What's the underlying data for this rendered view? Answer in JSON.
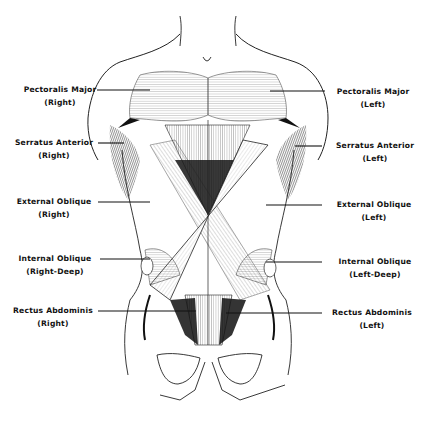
{
  "figure": {
    "ink_color": "#1a1a1a",
    "background": "#ffffff"
  },
  "labels": {
    "left_side": [
      {
        "name": "Pectoralis Major",
        "side": "(Right)"
      },
      {
        "name": "Serratus Anterior",
        "side": "(Right)"
      },
      {
        "name": "External Oblique",
        "side": "(Right)"
      },
      {
        "name": "Internal Oblique",
        "side": "(Right-Deep)"
      },
      {
        "name": "Rectus Abdominis",
        "side": "(Right)"
      }
    ],
    "right_side": [
      {
        "name": "Pectoralis Major",
        "side": "(Left)"
      },
      {
        "name": "Serratus Anterior",
        "side": "(Left)"
      },
      {
        "name": "External Oblique",
        "side": "(Left)"
      },
      {
        "name": "Internal Oblique",
        "side": "(Left-Deep)"
      },
      {
        "name": "Rectus Abdominis",
        "side": "(Left)"
      }
    ]
  }
}
